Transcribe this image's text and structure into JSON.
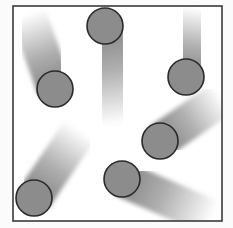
{
  "diagram": {
    "title": "",
    "colors": {
      "background": "#fbfbfb",
      "box_fill": "#ffffff",
      "box_border": "#3a3a3a",
      "particle_fill": "#8c8c8c",
      "particle_outline": "#2a2a2a",
      "trail": "#6e6e6e"
    },
    "box": {
      "x": 13,
      "y": 6,
      "width": 209,
      "height": 215
    },
    "particle_radius": 18,
    "particles": [
      {
        "id": "p1",
        "cx": 55,
        "cy": 89,
        "trail_end": [
          28,
          14
        ],
        "trail_width": 36
      },
      {
        "id": "p2",
        "cx": 105,
        "cy": 26,
        "trail_end": [
          120,
          124
        ],
        "trail_width": 36
      },
      {
        "id": "p3",
        "cx": 186,
        "cy": 77,
        "trail_end": [
          198,
          8
        ],
        "trail_width": 36
      },
      {
        "id": "p4",
        "cx": 160,
        "cy": 141,
        "trail_end": [
          222,
          98
        ],
        "trail_width": 36
      },
      {
        "id": "p5",
        "cx": 34,
        "cy": 198,
        "trail_end": [
          80,
          130
        ],
        "trail_width": 36
      },
      {
        "id": "p6",
        "cx": 122,
        "cy": 179,
        "trail_end": [
          212,
          218
        ],
        "trail_width": 36
      }
    ]
  }
}
